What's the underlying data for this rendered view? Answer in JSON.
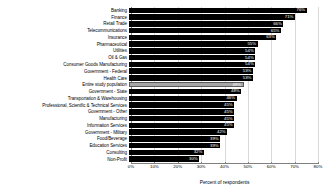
{
  "chart_data": {
    "type": "bar",
    "orientation": "horizontal",
    "title": "",
    "xlabel": "Percent of respondents",
    "ylabel": "",
    "xlim": [
      0,
      80
    ],
    "xticks": [
      "0%",
      "10%",
      "20%",
      "30%",
      "40%",
      "50%",
      "60%",
      "70%",
      "80%"
    ],
    "xtick_values": [
      0,
      10,
      20,
      30,
      40,
      50,
      60,
      70,
      80
    ],
    "grid": true,
    "legend": "none",
    "categories": [
      "Banking",
      "Finance",
      "Retail Trade",
      "Telecommunications",
      "Insurance",
      "Pharmaceutical",
      "Utilities",
      "Oil & Gas",
      "Consumer Goods Manufacturing",
      "Government - Federal",
      "Health Care",
      "Entire study population",
      "Government - State",
      "Transportation & Warehousing",
      "Professional, Scientfic & Technical Services",
      "Government - Other",
      "Manufacturing",
      "Information Services",
      "Government - Military",
      "Food/Beverage",
      "Education Services",
      "Consulting",
      "Non-Profit"
    ],
    "values": [
      76,
      71,
      66,
      65,
      63,
      55,
      54,
      54,
      54,
      53,
      53,
      49,
      48,
      46,
      45,
      45,
      45,
      45,
      42,
      39,
      39,
      32,
      30
    ],
    "value_labels": [
      "76%",
      "71%",
      "66%",
      "65%",
      "63%",
      "55%",
      "54%",
      "54%",
      "54%",
      "53%",
      "53%",
      "49%",
      "48%",
      "46%",
      "45%",
      "45%",
      "45%",
      "45%",
      "42%",
      "39%",
      "39%",
      "32%",
      "30%"
    ],
    "highlight_index": 11,
    "colors": {
      "bar": "#000000",
      "bar_highlight": "#a6a6a6",
      "bar_highlight_border": "#5a5a5a",
      "value_label": "#ffffff",
      "gridline": "#d9d9d9",
      "axis": "#808080",
      "text": "#000000",
      "background": "#ffffff"
    }
  }
}
